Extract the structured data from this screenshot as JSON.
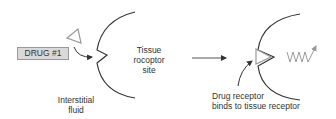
{
  "diagram": {
    "left_panel": {
      "drug_label": "DRUG #1",
      "receptor_label_line1": "Tissue",
      "receptor_label_line2": "rocoptor",
      "receptor_label_line3": "site",
      "fluid_label_line1": "Interstitial",
      "fluid_label_line2": "fluid"
    },
    "right_panel": {
      "binding_label_line1": "Drug receptor",
      "binding_label_line2": "binds to tissue receptor"
    },
    "colors": {
      "line": "#333333",
      "drug_shape": "#999999",
      "drug_box_fill": "#d9d9d9",
      "response": "#999999"
    }
  }
}
